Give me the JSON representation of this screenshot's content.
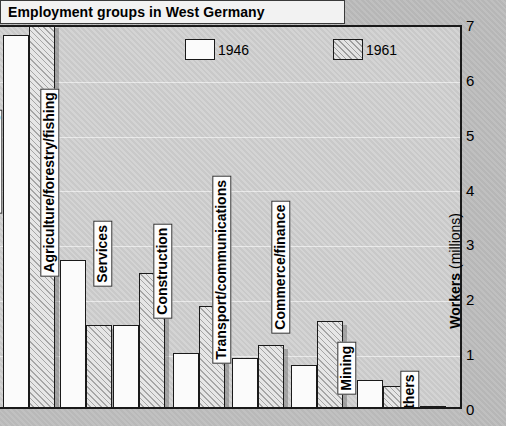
{
  "chart_data": {
    "type": "bar",
    "title": "Employment groups in West Germany",
    "xlabel": "",
    "ylabel": "Workers (millions)",
    "ylabel_bold": "Workers",
    "ylabel_unit": "(millions)",
    "ylim": [
      0,
      7
    ],
    "yticks": [
      "0",
      "1",
      "2",
      "3",
      "4",
      "5",
      "6",
      "7"
    ],
    "grid": true,
    "legend_position": "top",
    "categories": [
      "Manufacturing",
      "Agriculture/forestry/fishing",
      "Services",
      "Construction",
      "Transport/communications",
      "Commerce/finance",
      "Mining",
      "Others"
    ],
    "series": [
      {
        "name": "1946",
        "values": [
          6.85,
          2.75,
          1.57,
          1.06,
          0.97,
          0.84,
          0.57,
          0.1
        ]
      },
      {
        "name": "1961",
        "values": [
          7.05,
          1.57,
          2.52,
          1.92,
          1.21,
          1.65,
          0.46,
          0.05
        ]
      }
    ]
  },
  "legend": {
    "items": [
      {
        "label": "1946",
        "style": "plain"
      },
      {
        "label": "1961",
        "style": "hatched"
      }
    ]
  },
  "colors": {
    "bar_1946": "#fbfbfb",
    "bar_1961": "#e6e6e6",
    "outline": "#1a1a1a",
    "plot_bg": "#d2d2d2",
    "page_bg": "#bdbdbd",
    "title_bg": "#f2f2f2"
  }
}
